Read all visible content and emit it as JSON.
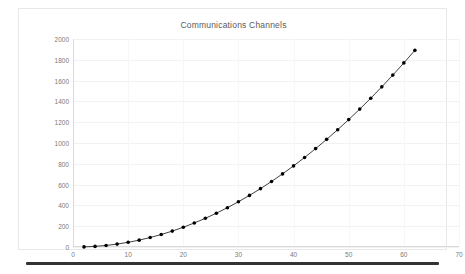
{
  "chart_data": {
    "type": "line",
    "title": "Communications Channels",
    "xlabel": "",
    "ylabel": "",
    "xlim": [
      0,
      70
    ],
    "ylim": [
      0,
      2000
    ],
    "xticks": [
      0,
      10,
      20,
      30,
      40,
      50,
      60,
      70
    ],
    "yticks": [
      0,
      200,
      400,
      600,
      800,
      1000,
      1200,
      1400,
      1600,
      1800,
      2000
    ],
    "grid": true,
    "legend": "none",
    "marker": "filled-circle",
    "line_color": "#2b2b2b",
    "marker_color": "#000000",
    "grid_color": "#f2f2f2",
    "x": [
      2,
      4,
      6,
      8,
      10,
      12,
      14,
      16,
      18,
      20,
      22,
      24,
      26,
      28,
      30,
      32,
      34,
      36,
      38,
      40,
      42,
      44,
      46,
      48,
      50,
      52,
      54,
      56,
      58,
      60,
      62
    ],
    "values": [
      1,
      6,
      15,
      28,
      45,
      66,
      91,
      120,
      153,
      190,
      231,
      276,
      325,
      378,
      435,
      496,
      561,
      630,
      703,
      780,
      861,
      946,
      1035,
      1128,
      1225,
      1326,
      1431,
      1540,
      1653,
      1770,
      1891
    ],
    "series": [
      {
        "name": "Communications Channels",
        "x": [
          2,
          4,
          6,
          8,
          10,
          12,
          14,
          16,
          18,
          20,
          22,
          24,
          26,
          28,
          30,
          32,
          34,
          36,
          38,
          40,
          42,
          44,
          46,
          48,
          50,
          52,
          54,
          56,
          58,
          60,
          62
        ],
        "values": [
          1,
          6,
          15,
          28,
          45,
          66,
          91,
          120,
          153,
          190,
          231,
          276,
          325,
          378,
          435,
          496,
          561,
          630,
          703,
          780,
          861,
          946,
          1035,
          1128,
          1225,
          1326,
          1431,
          1540,
          1653,
          1770,
          1891
        ]
      }
    ]
  },
  "ghost_marks": [
    {
      "text": "",
      "x": 315,
      "y": 10
    },
    {
      "text": "",
      "x": 305,
      "y": 28
    }
  ]
}
